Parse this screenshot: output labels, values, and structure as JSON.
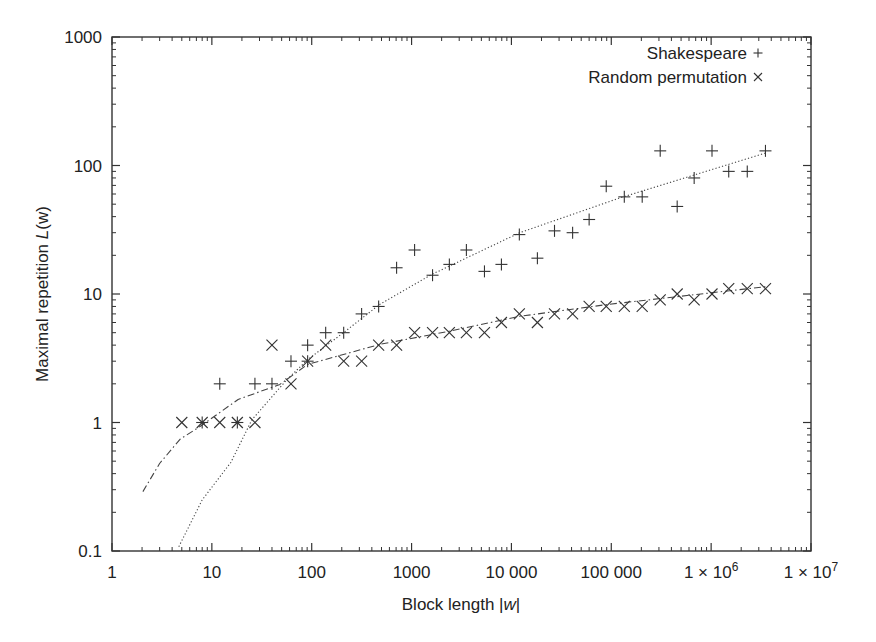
{
  "chart_data": {
    "type": "scatter",
    "title": "",
    "xlabel": "Block length |w|",
    "ylabel": "Maximal repetition L(w)",
    "xscale": "log",
    "yscale": "log",
    "xlim": [
      1,
      10000000
    ],
    "ylim": [
      0.1,
      1000
    ],
    "grid": false,
    "legend_position": "top-right",
    "x_ticks": [
      {
        "value": 1,
        "label": "1"
      },
      {
        "value": 10,
        "label": "10"
      },
      {
        "value": 100,
        "label": "100"
      },
      {
        "value": 1000,
        "label": "1000"
      },
      {
        "value": 10000,
        "label": "10 000"
      },
      {
        "value": 100000,
        "label": "100 000"
      },
      {
        "value": 1000000,
        "label": "1 × 10",
        "sup": "6"
      },
      {
        "value": 10000000,
        "label": "1 × 10",
        "sup": "7"
      }
    ],
    "y_ticks": [
      {
        "value": 0.1,
        "label": "0.1"
      },
      {
        "value": 1,
        "label": "1"
      },
      {
        "value": 10,
        "label": "10"
      },
      {
        "value": 100,
        "label": "100"
      },
      {
        "value": 1000,
        "label": "1000"
      }
    ],
    "series": [
      {
        "name": "Shakespeare",
        "marker": "+",
        "points": [
          [
            8,
            1
          ],
          [
            12,
            2
          ],
          [
            18,
            1
          ],
          [
            27,
            2
          ],
          [
            40,
            2
          ],
          [
            62,
            3
          ],
          [
            91,
            4
          ],
          [
            91,
            3
          ],
          [
            138,
            5
          ],
          [
            209,
            5
          ],
          [
            316,
            7
          ],
          [
            468,
            8
          ],
          [
            708,
            16
          ],
          [
            1072,
            22
          ],
          [
            1622,
            14
          ],
          [
            2390,
            17
          ],
          [
            3540,
            22
          ],
          [
            5370,
            15
          ],
          [
            7940,
            17
          ],
          [
            12000,
            29
          ],
          [
            18200,
            19
          ],
          [
            27000,
            31
          ],
          [
            41000,
            30
          ],
          [
            60000,
            38
          ],
          [
            89000,
            69
          ],
          [
            135000,
            57
          ],
          [
            204000,
            57
          ],
          [
            309000,
            130
          ],
          [
            457000,
            48
          ],
          [
            676000,
            80
          ],
          [
            1020000,
            130
          ],
          [
            1500000,
            90
          ],
          [
            2300000,
            90
          ],
          [
            3500000,
            130
          ]
        ],
        "fit": {
          "style": "dotted",
          "points": [
            [
              4.67,
              0.108
            ],
            [
              8,
              0.25
            ],
            [
              15.5,
              0.49
            ],
            [
              25.2,
              1.05
            ],
            [
              56.6,
              2.16
            ],
            [
              91.4,
              3.09
            ],
            [
              215,
              5.1
            ],
            [
              480,
              8.3
            ],
            [
              1595,
              14.2
            ],
            [
              12100,
              30
            ],
            [
              122000,
              56
            ],
            [
              3500000,
              125
            ]
          ]
        }
      },
      {
        "name": "Random permutation",
        "marker": "x",
        "points": [
          [
            5,
            1
          ],
          [
            8,
            1
          ],
          [
            12,
            1
          ],
          [
            18,
            1
          ],
          [
            27,
            1
          ],
          [
            40,
            4
          ],
          [
            62,
            2
          ],
          [
            91,
            3
          ],
          [
            138,
            4
          ],
          [
            209,
            3
          ],
          [
            316,
            3
          ],
          [
            468,
            4
          ],
          [
            708,
            4
          ],
          [
            1072,
            5
          ],
          [
            1622,
            5
          ],
          [
            2390,
            5
          ],
          [
            3540,
            5
          ],
          [
            5370,
            5
          ],
          [
            7940,
            6
          ],
          [
            12000,
            7
          ],
          [
            18200,
            6
          ],
          [
            27000,
            7
          ],
          [
            41000,
            7
          ],
          [
            60000,
            8
          ],
          [
            89000,
            8
          ],
          [
            135000,
            8
          ],
          [
            204000,
            8
          ],
          [
            309000,
            9
          ],
          [
            457000,
            10
          ],
          [
            676000,
            9
          ],
          [
            1020000,
            10
          ],
          [
            1500000,
            11
          ],
          [
            2300000,
            11
          ],
          [
            3500000,
            11
          ]
        ],
        "fit": {
          "style": "dash-dot",
          "points": [
            [
              2.04,
              0.29
            ],
            [
              3,
              0.48
            ],
            [
              4.8,
              0.74
            ],
            [
              7.6,
              0.93
            ],
            [
              18.3,
              1.51
            ],
            [
              48,
              1.98
            ],
            [
              91,
              2.83
            ],
            [
              480,
              4.05
            ],
            [
              2290,
              5.1
            ],
            [
              12100,
              6.7
            ],
            [
              93000,
              8.3
            ],
            [
              3500000,
              11.4
            ]
          ]
        }
      }
    ]
  },
  "legend": {
    "items": [
      {
        "label": "Shakespeare",
        "symbol": "+"
      },
      {
        "label": "Random permutation",
        "symbol": "×"
      }
    ]
  },
  "axes": {
    "xlabel_prefix": "Block length |",
    "xlabel_var": "w",
    "xlabel_suffix": "|",
    "ylabel_prefix": "Maximal repetition ",
    "ylabel_var": "L",
    "ylabel_suffix": "(w)"
  },
  "colors": {
    "axis": "#333333",
    "marker": "#333333",
    "fit": "#444444",
    "text": "#222222"
  }
}
